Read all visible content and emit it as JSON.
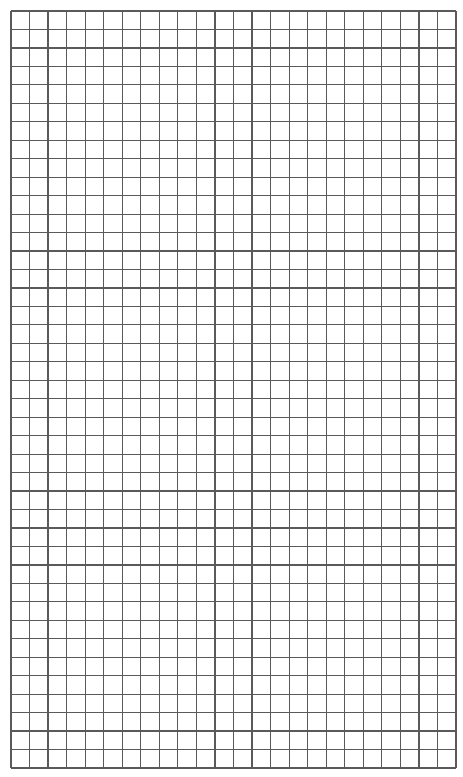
{
  "sheet": {
    "type": "graph-paper",
    "columns": 24,
    "rows": 41,
    "cell_width": 18.54,
    "cell_height": 18.46,
    "width": 445,
    "height": 757,
    "line_color": "#5a5a5a",
    "background": "#ffffff"
  }
}
